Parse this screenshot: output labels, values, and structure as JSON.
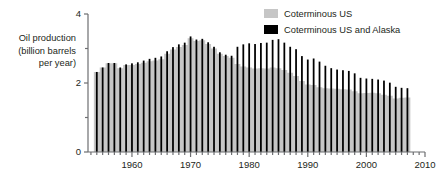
{
  "chart_data": {
    "type": "bar",
    "title": "",
    "subtitle": "",
    "xlabel": "",
    "ylabel": "Oil production (billion barrels per year)",
    "ylabel_lines": [
      "Oil production",
      "(billion barrels",
      "per year)"
    ],
    "xlim": [
      1952.5,
      2010
    ],
    "ylim": [
      0,
      4
    ],
    "x_ticks_major": [
      1960,
      1970,
      1980,
      1990,
      2000,
      2010
    ],
    "x_ticks_minor_step": 1,
    "y_ticks_major": [
      0,
      2,
      4
    ],
    "y_ticks_minor": [
      1,
      3
    ],
    "grid": false,
    "legend_position": "top-right",
    "colors": {
      "coterminous_us": "#c6c6c6",
      "coterminous_us_and_alaska": "#000000",
      "axis": "#6d6e71",
      "text": "#231f20",
      "background": "#ffffff"
    },
    "legend": [
      {
        "label": "Coterminous US",
        "color": "#c6c6c6"
      },
      {
        "label": "Coterminous US and Alaska",
        "color": "#000000"
      }
    ],
    "x": [
      1954,
      1955,
      1956,
      1957,
      1958,
      1959,
      1960,
      1961,
      1962,
      1963,
      1964,
      1965,
      1966,
      1967,
      1968,
      1969,
      1970,
      1971,
      1972,
      1973,
      1974,
      1975,
      1976,
      1977,
      1978,
      1979,
      1980,
      1981,
      1982,
      1983,
      1984,
      1985,
      1986,
      1987,
      1988,
      1989,
      1990,
      1991,
      1992,
      1993,
      1994,
      1995,
      1996,
      1997,
      1998,
      1999,
      2000,
      2001,
      2002,
      2003,
      2004,
      2005,
      2006,
      2007
    ],
    "series": [
      {
        "name": "Coterminous US",
        "color": "#c6c6c6",
        "values": [
          2.32,
          2.45,
          2.57,
          2.57,
          2.43,
          2.52,
          2.52,
          2.55,
          2.59,
          2.63,
          2.65,
          2.69,
          2.85,
          2.97,
          3.04,
          3.1,
          3.3,
          3.22,
          3.24,
          3.13,
          3.0,
          2.85,
          2.78,
          2.73,
          2.55,
          2.48,
          2.45,
          2.42,
          2.43,
          2.42,
          2.45,
          2.43,
          2.38,
          2.3,
          2.2,
          2.06,
          1.96,
          1.94,
          1.88,
          1.85,
          1.84,
          1.83,
          1.82,
          1.81,
          1.76,
          1.7,
          1.71,
          1.72,
          1.7,
          1.66,
          1.63,
          1.55,
          1.57,
          1.58
        ]
      },
      {
        "name": "Coterminous US and Alaska",
        "color": "#000000",
        "values": [
          2.32,
          2.45,
          2.58,
          2.58,
          2.45,
          2.54,
          2.57,
          2.6,
          2.65,
          2.7,
          2.73,
          2.77,
          2.92,
          3.04,
          3.12,
          3.17,
          3.35,
          3.26,
          3.28,
          3.18,
          3.05,
          2.89,
          2.82,
          2.79,
          3.05,
          3.12,
          3.15,
          3.13,
          3.16,
          3.17,
          3.25,
          3.27,
          3.17,
          3.05,
          2.98,
          2.78,
          2.68,
          2.71,
          2.62,
          2.5,
          2.43,
          2.39,
          2.37,
          2.35,
          2.28,
          2.15,
          2.13,
          2.12,
          2.1,
          2.07,
          2.01,
          1.89,
          1.86,
          1.85
        ]
      }
    ]
  },
  "legend_box": {
    "items": [
      {
        "swatch_name": "legend-swatch-coterminous-us",
        "label": "Coterminous US"
      },
      {
        "swatch_name": "legend-swatch-coterminous-us-alaska",
        "label": "Coterminous US and Alaska"
      }
    ]
  },
  "axis_labels": {
    "y_line_1": "Oil production",
    "y_line_2": "(billion barrels",
    "y_line_3": "per year)"
  }
}
